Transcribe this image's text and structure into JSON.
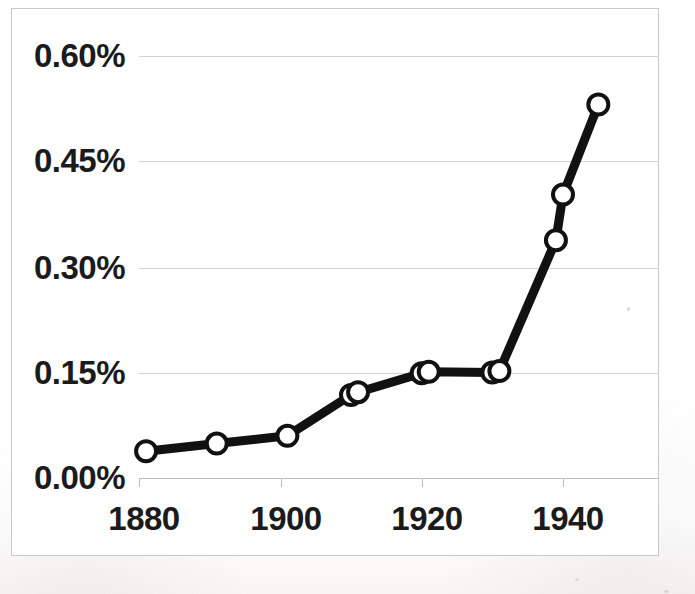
{
  "chart_data": {
    "type": "line",
    "title": "",
    "subtitle": "",
    "xlabel": "",
    "ylabel": "",
    "xlim": [
      1877,
      1950
    ],
    "ylim": [
      0.0,
      0.6
    ],
    "grid": true,
    "legend": false,
    "legend_position": "none",
    "y_tick_labels": [
      "0.00%",
      "0.15%",
      "0.30%",
      "0.45%",
      "0.60%"
    ],
    "y_tick_values": [
      0.0,
      0.15,
      0.3,
      0.45,
      0.6
    ],
    "x_tick_labels": [
      "1880",
      "1900",
      "1920",
      "1940"
    ],
    "x_tick_values": [
      1880,
      1900,
      1920,
      1940
    ],
    "marker": "open-circle",
    "line_color": "#111111",
    "marker_face_color": "#ffffff",
    "marker_edge_color": "#111111",
    "gridline_color": "#d4d4d4",
    "x": [
      1881,
      1891,
      1901,
      1910,
      1911,
      1920,
      1921,
      1930,
      1931,
      1939,
      1940,
      1945
    ],
    "values": [
      0.038,
      0.049,
      0.06,
      0.118,
      0.122,
      0.149,
      0.151,
      0.15,
      0.152,
      0.338,
      0.403,
      0.531
    ],
    "series": [
      {
        "name": "",
        "points": [
          {
            "x": 1881,
            "y": 0.038
          },
          {
            "x": 1891,
            "y": 0.049
          },
          {
            "x": 1901,
            "y": 0.06
          },
          {
            "x": 1910,
            "y": 0.118
          },
          {
            "x": 1911,
            "y": 0.122
          },
          {
            "x": 1920,
            "y": 0.149
          },
          {
            "x": 1921,
            "y": 0.151
          },
          {
            "x": 1930,
            "y": 0.15
          },
          {
            "x": 1931,
            "y": 0.152
          },
          {
            "x": 1939,
            "y": 0.338
          },
          {
            "x": 1940,
            "y": 0.403
          },
          {
            "x": 1945,
            "y": 0.531
          }
        ]
      }
    ],
    "annotations": []
  },
  "axes": {
    "y_labels": [
      {
        "text": "0.60%",
        "value": 0.6
      },
      {
        "text": "0.45%",
        "value": 0.45
      },
      {
        "text": "0.30%",
        "value": 0.3
      },
      {
        "text": "0.15%",
        "value": 0.15
      },
      {
        "text": "0.00%",
        "value": 0.0
      }
    ],
    "x_labels": [
      {
        "text": "1880",
        "value": 1880
      },
      {
        "text": "1900",
        "value": 1900
      },
      {
        "text": "1920",
        "value": 1920
      },
      {
        "text": "1940",
        "value": 1940
      }
    ]
  }
}
